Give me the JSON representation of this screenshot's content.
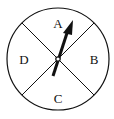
{
  "diagram": {
    "type": "spinner",
    "sections": [
      {
        "label": "A",
        "position": "top"
      },
      {
        "label": "B",
        "position": "right"
      },
      {
        "label": "C",
        "position": "bottom"
      },
      {
        "label": "D",
        "position": "left"
      }
    ],
    "pointer": {
      "points_to": "A"
    },
    "colors": {
      "stroke": "#111111",
      "background": "#ffffff"
    }
  }
}
